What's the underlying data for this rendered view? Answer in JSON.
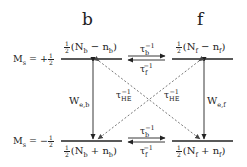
{
  "columns": [
    {
      "id": "b",
      "title": "b"
    },
    {
      "id": "f",
      "title": "f"
    }
  ],
  "levels": [
    {
      "id": "upper",
      "ms_label": "M",
      "ms_sub": "s",
      "ms_eq": " = +",
      "ms_frac_num": "1",
      "ms_frac_den": "2"
    },
    {
      "id": "lower",
      "ms_label": "M",
      "ms_sub": "s",
      "ms_eq": " = −",
      "ms_frac_num": "1",
      "ms_frac_den": "2"
    }
  ],
  "populations": {
    "b_upper": {
      "frac_num": "1",
      "frac_den": "2",
      "text_pre": "(N",
      "sub1": "b",
      "op": " − n",
      "sub2": "b",
      "text_post": ")"
    },
    "f_upper": {
      "frac_num": "1",
      "frac_den": "2",
      "text_pre": "(N",
      "sub1": "f",
      "op": " − n",
      "sub2": "f",
      "text_post": ")"
    },
    "b_lower": {
      "frac_num": "1",
      "frac_den": "2",
      "text_pre": "(N",
      "sub1": "b",
      "op": " + n",
      "sub2": "b",
      "text_post": ")"
    },
    "f_lower": {
      "frac_num": "1",
      "frac_den": "2",
      "text_pre": "(N",
      "sub1": "f",
      "op": " + n",
      "sub2": "f",
      "text_post": ")"
    }
  },
  "rates": {
    "tau_b_inv": {
      "base": "τ",
      "sub": "b",
      "sup": "−1"
    },
    "tau_f_inv": {
      "base": "τ",
      "sub": "f",
      "sup": "−1"
    },
    "tau_he_inv": {
      "base": "τ",
      "sub": "HE",
      "sup": "−1"
    },
    "w_eb": {
      "base": "W",
      "sub": "e,b"
    },
    "w_ef": {
      "base": "W",
      "sub": "e,f"
    }
  },
  "colors": {
    "line": "#222222",
    "dashed": "#555555",
    "background": "#ffffff"
  }
}
